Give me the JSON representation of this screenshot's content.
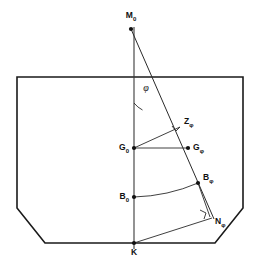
{
  "figure": {
    "background_color": "#ffffff",
    "line_color": "#1a1a1a",
    "width": 259,
    "height": 260
  },
  "hull": {
    "name": "ship-hull-cross-section",
    "points": "17,77 243,77 243,208 215,243 45,243 17,208"
  },
  "axes": {
    "centerline": {
      "x1": 134,
      "y1": 27,
      "x2": 134,
      "y2": 249
    },
    "inclined_axis": {
      "x1": 131,
      "y1": 29,
      "x2": 214,
      "y2": 219
    }
  },
  "segments": {
    "g0_to_gphi": {
      "x1": 134,
      "y1": 148,
      "x2": 188,
      "y2": 148
    },
    "g0_to_zphi": {
      "x1": 134,
      "y1": 148,
      "x2": 180,
      "y2": 127
    },
    "bphi_to_nphi": {
      "x1": 198,
      "y1": 183,
      "x2": 210,
      "y2": 217
    },
    "k_to_nphi": {
      "x1": 134,
      "y1": 243,
      "x2": 212,
      "y2": 218
    }
  },
  "curves": {
    "b_locus_arc": "M 134,197 Q 168,196 198,183",
    "phi_angle_arc": "M 134,103 A 26,26 0 0 0 142.5,110",
    "z_right_angle": "M 172,126 L 176,131 L 180,127",
    "n_right_angle": "M 200,210 L 206,213 L 204,219"
  },
  "points": [
    {
      "id": "M0",
      "name": "point-m0",
      "x": 131,
      "y": 29,
      "label": "M",
      "sub": "0",
      "label_x": 131,
      "label_y": 16,
      "anchor": "middle",
      "dot": true
    },
    {
      "id": "Zphi",
      "name": "point-zphi",
      "x": 180,
      "y": 127,
      "label": "Z",
      "sub": "φ",
      "label_x": 184,
      "label_y": 122,
      "anchor": "start",
      "dot": false
    },
    {
      "id": "G0",
      "name": "point-g0",
      "x": 134,
      "y": 148,
      "label": "G",
      "sub": "0",
      "label_x": 129,
      "label_y": 148,
      "anchor": "end",
      "dot": true
    },
    {
      "id": "Gphi",
      "name": "point-gphi",
      "x": 188,
      "y": 148,
      "label": "G",
      "sub": "φ",
      "label_x": 193,
      "label_y": 148,
      "anchor": "start",
      "dot": true
    },
    {
      "id": "Bphi",
      "name": "point-bphi",
      "x": 198,
      "y": 183,
      "label": "B",
      "sub": "φ",
      "label_x": 203,
      "label_y": 178,
      "anchor": "start",
      "dot": true
    },
    {
      "id": "B0",
      "name": "point-b0",
      "x": 134,
      "y": 197,
      "label": "B",
      "sub": "0",
      "label_x": 129,
      "label_y": 197,
      "anchor": "end",
      "dot": true
    },
    {
      "id": "Nphi",
      "name": "point-nphi",
      "x": 210,
      "y": 217,
      "label": "N",
      "sub": "φ",
      "label_x": 215,
      "label_y": 222,
      "anchor": "start",
      "dot": false
    },
    {
      "id": "K",
      "name": "point-k",
      "x": 134,
      "y": 243,
      "label": "K",
      "sub": "",
      "label_x": 134,
      "label_y": 253,
      "anchor": "middle",
      "dot": true
    }
  ],
  "angle": {
    "name": "heel-angle-phi",
    "symbol": "φ",
    "label_x": 146,
    "label_y": 89
  }
}
